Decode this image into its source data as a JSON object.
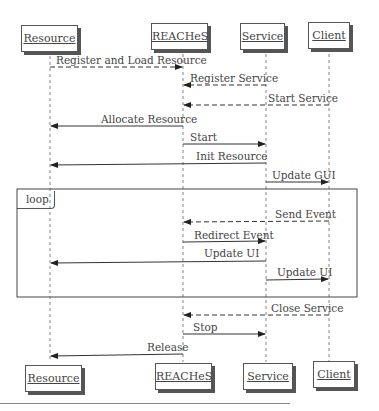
{
  "diagram": {
    "type": "sequence",
    "participants": [
      "Resource",
      "REACHeS",
      "Service",
      "Client"
    ],
    "messages": [
      {
        "label": "Register and Load Resource",
        "from": "Resource",
        "to": "REACHeS",
        "style": "dashed"
      },
      {
        "label": "Register Service",
        "from": "Service",
        "to": "REACHeS",
        "style": "dashed"
      },
      {
        "label": "Start Service",
        "from": "Client",
        "to": "REACHeS",
        "style": "dashed"
      },
      {
        "label": "Allocate Resource",
        "from": "REACHeS",
        "to": "Resource",
        "style": "solid"
      },
      {
        "label": "Start",
        "from": "REACHeS",
        "to": "Service",
        "style": "solid"
      },
      {
        "label": "Init Resource",
        "from": "Service",
        "to": "Resource",
        "style": "solid"
      },
      {
        "label": "Update GUI",
        "from": "Service",
        "to": "Client",
        "style": "solid"
      },
      {
        "label": "Send Event",
        "from": "Client",
        "to": "REACHeS",
        "style": "dashed",
        "in_loop": true
      },
      {
        "label": "Redirect Event",
        "from": "REACHeS",
        "to": "Service",
        "style": "solid",
        "in_loop": true
      },
      {
        "label": "Update UI",
        "from": "Service",
        "to": "Resource",
        "style": "solid",
        "in_loop": true
      },
      {
        "label": "Update UI",
        "from": "Service",
        "to": "Client",
        "style": "solid",
        "in_loop": true
      },
      {
        "label": "Close Service",
        "from": "Client",
        "to": "REACHeS",
        "style": "dashed"
      },
      {
        "label": "Stop",
        "from": "REACHeS",
        "to": "Service",
        "style": "solid"
      },
      {
        "label": "Release",
        "from": "REACHeS",
        "to": "Resource",
        "style": "solid"
      }
    ],
    "fragment": {
      "label": "loop"
    }
  }
}
